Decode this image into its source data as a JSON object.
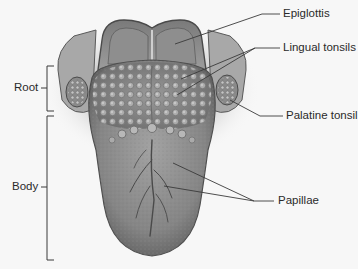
{
  "figure": {
    "labels": {
      "epiglottis": "Epiglottis",
      "lingual_tonsils": "Lingual tonsils",
      "palatine_tonsil": "Palatine tonsil",
      "papillae": "Papillae",
      "root": "Root",
      "body": "Body"
    },
    "colors": {
      "background": "#f7f7f7",
      "tongue": "#8a8a8a",
      "leader_line": "#3a3a3a",
      "text": "#2a2a2a"
    }
  }
}
